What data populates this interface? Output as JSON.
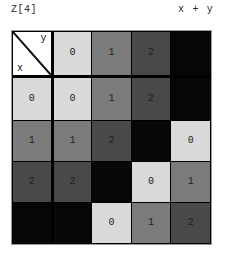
{
  "header": {
    "table_name": "Z[4]",
    "operation": "x + y"
  },
  "corner": {
    "row_axis_label": "x",
    "col_axis_label": "y",
    "diagonal_icon": "diagonal-divider-icon"
  },
  "palette": {
    "value_0": "#d9d9d9",
    "value_1": "#7b7b7b",
    "value_2": "#494949",
    "value_3": "#070707",
    "grid_line": "#000000",
    "corner_bg": "#ffffff",
    "page_bg": "#ffffff",
    "text": "#2b2b2b"
  },
  "chart_data": {
    "type": "table",
    "title": "Z[4]",
    "operation": "x + y",
    "modulus": 4,
    "elements": [
      "0",
      "1",
      "2",
      "3"
    ],
    "column_headers": [
      "0",
      "1",
      "2",
      "3"
    ],
    "row_headers": [
      "0",
      "1",
      "2",
      "3"
    ],
    "cells": [
      [
        "0",
        "1",
        "2",
        "3"
      ],
      [
        "1",
        "2",
        "3",
        "0"
      ],
      [
        "2",
        "3",
        "0",
        "1"
      ],
      [
        "3",
        "0",
        "1",
        "2"
      ]
    ],
    "header_col_shades": [
      "#d9d9d9",
      "#7b7b7b",
      "#494949",
      "#070707"
    ],
    "header_row_shades": [
      "#d9d9d9",
      "#7b7b7b",
      "#494949",
      "#070707"
    ],
    "note": "Cayley table of addition modulo 4; cell shade encodes the value (0 lightest, 3 black so its digit is not legible)"
  },
  "grid": {
    "header_row": [
      {
        "label": "0",
        "shade": "v0",
        "tone": "t-dark"
      },
      {
        "label": "1",
        "shade": "v1",
        "tone": "t-mid"
      },
      {
        "label": "2",
        "shade": "v2",
        "tone": "t-mid"
      },
      {
        "label": "3",
        "shade": "v3",
        "tone": "t-hide"
      }
    ],
    "rows": [
      {
        "header": {
          "label": "0",
          "shade": "v0",
          "tone": "t-dark"
        },
        "cells": [
          {
            "label": "0",
            "shade": "v0",
            "tone": "t-dark"
          },
          {
            "label": "1",
            "shade": "v1",
            "tone": "t-mid"
          },
          {
            "label": "2",
            "shade": "v2",
            "tone": "t-mid"
          },
          {
            "label": "3",
            "shade": "v3",
            "tone": "t-hide"
          }
        ]
      },
      {
        "header": {
          "label": "1",
          "shade": "v1",
          "tone": "t-mid"
        },
        "cells": [
          {
            "label": "1",
            "shade": "v1",
            "tone": "t-mid"
          },
          {
            "label": "2",
            "shade": "v2",
            "tone": "t-mid"
          },
          {
            "label": "3",
            "shade": "v3",
            "tone": "t-hide"
          },
          {
            "label": "0",
            "shade": "v0",
            "tone": "t-dark"
          }
        ]
      },
      {
        "header": {
          "label": "2",
          "shade": "v2",
          "tone": "t-mid"
        },
        "cells": [
          {
            "label": "2",
            "shade": "v2",
            "tone": "t-mid"
          },
          {
            "label": "3",
            "shade": "v3",
            "tone": "t-hide"
          },
          {
            "label": "0",
            "shade": "v0",
            "tone": "t-dark"
          },
          {
            "label": "1",
            "shade": "v1",
            "tone": "t-mid"
          }
        ]
      },
      {
        "header": {
          "label": "3",
          "shade": "v3",
          "tone": "t-hide"
        },
        "cells": [
          {
            "label": "3",
            "shade": "v3",
            "tone": "t-hide"
          },
          {
            "label": "0",
            "shade": "v0",
            "tone": "t-dark"
          },
          {
            "label": "1",
            "shade": "v1",
            "tone": "t-mid"
          },
          {
            "label": "2",
            "shade": "v2",
            "tone": "t-mid"
          }
        ]
      }
    ]
  }
}
